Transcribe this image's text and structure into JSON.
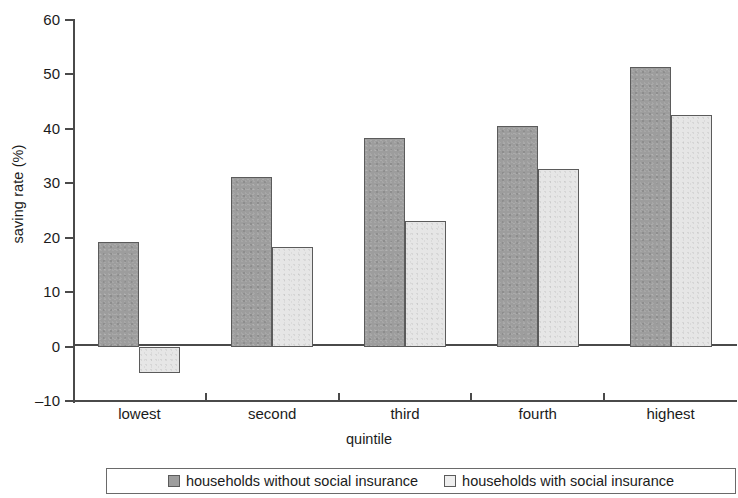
{
  "chart_data": {
    "type": "bar",
    "title": "",
    "xlabel": "quintile",
    "ylabel": "saving rate (%)",
    "categories": [
      "lowest",
      "second",
      "third",
      "fourth",
      "highest"
    ],
    "series": [
      {
        "name": "households without social insurance",
        "color": "#9d9d9d",
        "values": [
          19.2,
          31.2,
          38.3,
          40.6,
          51.3
        ]
      },
      {
        "name": "households with social insurance",
        "color": "#e6e6e6",
        "values": [
          -4.9,
          18.3,
          23.1,
          32.6,
          42.5
        ]
      }
    ],
    "ylim": [
      -10,
      60
    ],
    "yticks": [
      60,
      50,
      40,
      30,
      20,
      10,
      0,
      -10
    ],
    "ytick_labels": [
      "60",
      "50",
      "40",
      "30",
      "20",
      "10",
      "0",
      "–10"
    ],
    "grid": false,
    "legend_position": "bottom"
  },
  "legend": {
    "items": [
      {
        "label": "households without social insurance",
        "swatch": "dark-swatch"
      },
      {
        "label": "households with social insurance",
        "swatch": "light-swatch"
      }
    ]
  },
  "axes": {
    "y_title": "saving rate (%)",
    "x_title": "quintile"
  }
}
